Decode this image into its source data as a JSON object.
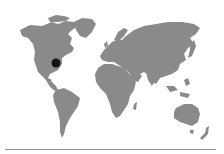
{
  "map": {
    "type": "world-map",
    "land_color": "#8a8a8a",
    "background_color": "#ffffff",
    "marker": {
      "icon": "location-dot-icon",
      "color": "#141414",
      "cx": 56,
      "cy": 63,
      "r": 4.5,
      "region": "Eastern United States"
    }
  },
  "footer": {
    "rule_color": "#8f8f8f"
  }
}
